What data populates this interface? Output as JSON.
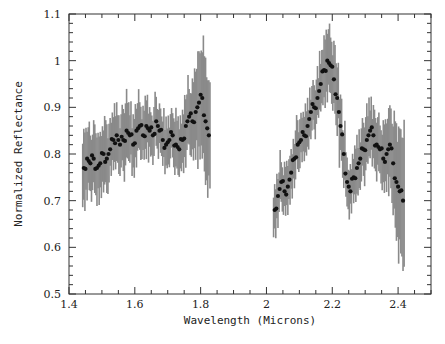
{
  "chart_data": {
    "type": "scatter",
    "title": "",
    "xlabel": "Wavelength (Microns)",
    "ylabel": "Normalized Reflectance",
    "xlim": [
      1.4,
      2.5
    ],
    "ylim": [
      0.5,
      1.1
    ],
    "xticks": [
      1.4,
      1.6,
      1.8,
      2.0,
      2.2,
      2.4
    ],
    "xtick_labels": [
      "1.4",
      "1.6",
      "1.8",
      "2",
      "2.2",
      "2.4"
    ],
    "yticks": [
      0.5,
      0.6,
      0.7,
      0.8,
      0.9,
      1.0,
      1.1
    ],
    "ytick_labels": [
      "0.5",
      "0.6",
      "0.7",
      "0.8",
      "0.9",
      "1",
      "1.1"
    ],
    "grid": false,
    "legend": null,
    "series": [
      {
        "name": "H-band segment",
        "x": [
          1.445,
          1.455,
          1.465,
          1.475,
          1.485,
          1.495,
          1.505,
          1.515,
          1.525,
          1.535,
          1.545,
          1.555,
          1.565,
          1.575,
          1.585,
          1.595,
          1.605,
          1.615,
          1.625,
          1.635,
          1.645,
          1.655,
          1.665,
          1.675,
          1.685,
          1.695,
          1.705,
          1.715,
          1.725,
          1.735,
          1.745,
          1.755,
          1.765,
          1.775,
          1.785,
          1.795,
          1.805,
          1.815,
          1.825
        ],
        "y": [
          0.77,
          0.79,
          0.78,
          0.79,
          0.77,
          0.78,
          0.8,
          0.79,
          0.81,
          0.83,
          0.84,
          0.82,
          0.83,
          0.85,
          0.84,
          0.82,
          0.85,
          0.86,
          0.84,
          0.86,
          0.85,
          0.84,
          0.87,
          0.85,
          0.83,
          0.82,
          0.83,
          0.84,
          0.82,
          0.81,
          0.83,
          0.86,
          0.88,
          0.87,
          0.89,
          0.91,
          0.92,
          0.87,
          0.84
        ],
        "err": [
          0.08,
          0.07,
          0.07,
          0.07,
          0.07,
          0.07,
          0.07,
          0.07,
          0.06,
          0.06,
          0.06,
          0.06,
          0.07,
          0.07,
          0.06,
          0.06,
          0.06,
          0.06,
          0.05,
          0.06,
          0.05,
          0.05,
          0.05,
          0.05,
          0.05,
          0.05,
          0.05,
          0.05,
          0.06,
          0.06,
          0.06,
          0.07,
          0.07,
          0.08,
          0.09,
          0.12,
          0.12,
          0.13,
          0.12
        ]
      },
      {
        "name": "K-band segment",
        "x": [
          2.025,
          2.035,
          2.045,
          2.055,
          2.065,
          2.075,
          2.085,
          2.095,
          2.105,
          2.115,
          2.125,
          2.135,
          2.145,
          2.155,
          2.165,
          2.175,
          2.185,
          2.195,
          2.205,
          2.215,
          2.225,
          2.235,
          2.245,
          2.255,
          2.265,
          2.275,
          2.285,
          2.295,
          2.305,
          2.315,
          2.325,
          2.335,
          2.345,
          2.355,
          2.365,
          2.375,
          2.385,
          2.395,
          2.405,
          2.415
        ],
        "y": [
          0.68,
          0.71,
          0.74,
          0.72,
          0.73,
          0.76,
          0.79,
          0.82,
          0.83,
          0.84,
          0.86,
          0.89,
          0.9,
          0.92,
          0.95,
          0.98,
          1.0,
          0.99,
          0.96,
          0.92,
          0.86,
          0.8,
          0.74,
          0.72,
          0.75,
          0.77,
          0.79,
          0.81,
          0.83,
          0.85,
          0.84,
          0.82,
          0.81,
          0.79,
          0.8,
          0.82,
          0.78,
          0.74,
          0.72,
          0.7
        ],
        "err": [
          0.05,
          0.05,
          0.05,
          0.05,
          0.05,
          0.05,
          0.05,
          0.05,
          0.05,
          0.05,
          0.05,
          0.05,
          0.05,
          0.05,
          0.06,
          0.07,
          0.07,
          0.07,
          0.07,
          0.07,
          0.07,
          0.06,
          0.05,
          0.05,
          0.05,
          0.06,
          0.06,
          0.06,
          0.06,
          0.06,
          0.06,
          0.06,
          0.06,
          0.07,
          0.07,
          0.09,
          0.1,
          0.12,
          0.14,
          0.15
        ]
      }
    ]
  }
}
